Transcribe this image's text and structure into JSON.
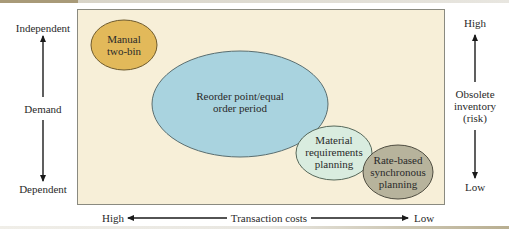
{
  "diagram": {
    "left_axis": {
      "title": "Demand",
      "top_label": "Independent",
      "bottom_label": "Dependent"
    },
    "right_axis": {
      "title_lines": [
        "Obsolete",
        "inventory",
        "(risk)"
      ],
      "top_label": "High",
      "bottom_label": "Low"
    },
    "bottom_axis": {
      "title": "Transaction costs",
      "left_label": "High",
      "right_label": "Low"
    },
    "ellipses": [
      {
        "id": "manual-two-bin",
        "lines": [
          "Manual",
          "two-bin"
        ],
        "color": "#e2b95a"
      },
      {
        "id": "reorder-point",
        "lines": [
          "Reorder point/equal",
          "order period"
        ],
        "color": "#a9d3df"
      },
      {
        "id": "mrp",
        "lines": [
          "Material",
          "requirements",
          "planning"
        ],
        "color": "#d9ecdf"
      },
      {
        "id": "rate-based",
        "lines": [
          "Rate-based",
          "synchronous",
          "planning"
        ],
        "color": "#b7b39c"
      }
    ],
    "colors": {
      "panel_background": "#f7efd8",
      "panel_border": "#8a8a80"
    }
  }
}
